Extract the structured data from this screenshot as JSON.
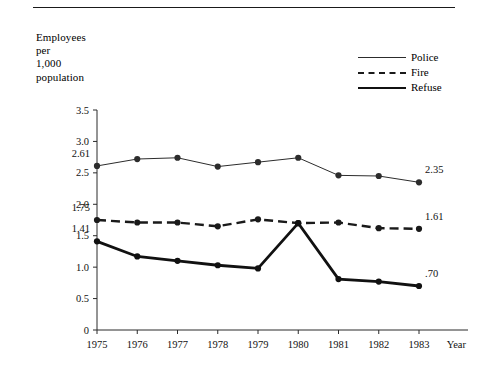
{
  "figure": {
    "axis_title": "Employees\nper\n1,000\npopulation",
    "year_axis_label": "Year",
    "top_rule": true
  },
  "legend": {
    "position": "top-right",
    "entries": [
      {
        "label": "Police",
        "style": "thin-solid",
        "color": "#2c2c2c"
      },
      {
        "label": "Fire",
        "style": "dashed",
        "color": "#1a1a1a"
      },
      {
        "label": "Refuse",
        "style": "thick-solid",
        "color": "#111111"
      }
    ]
  },
  "annotations": {
    "left": [
      {
        "series": "Police",
        "text": "2.61"
      },
      {
        "series": "Fire",
        "text": "1.75"
      },
      {
        "series": "Refuse",
        "text": "1.41"
      }
    ],
    "right": [
      {
        "series": "Police",
        "text": "2.35"
      },
      {
        "series": "Fire",
        "text": "1.61"
      },
      {
        "series": "Refuse",
        "text": ".70"
      }
    ]
  },
  "chart_data": {
    "type": "line",
    "title": "",
    "xlabel": "Year",
    "ylabel": "Employees per 1,000 population",
    "categories": [
      "1975",
      "1976",
      "1977",
      "1978",
      "1979",
      "1980",
      "1981",
      "1982",
      "1983"
    ],
    "x": [
      1975,
      1976,
      1977,
      1978,
      1979,
      1980,
      1981,
      1982,
      1983
    ],
    "ylim": [
      0,
      3.5
    ],
    "yticks": [
      0,
      0.5,
      1.0,
      1.5,
      2.0,
      2.5,
      3.0,
      3.5
    ],
    "ytick_labels": [
      "0",
      "0.5",
      "1.0",
      "1.5",
      "2.0",
      "2.5",
      "3.0",
      "3.5"
    ],
    "grid": false,
    "legend_position": "upper right",
    "markers": "filled-circle",
    "series": [
      {
        "name": "Police",
        "values": [
          2.61,
          2.72,
          2.74,
          2.6,
          2.67,
          2.74,
          2.46,
          2.45,
          2.35
        ],
        "style": "thin-solid",
        "color": "#2c2c2c",
        "first_label": "2.61",
        "last_label": "2.35"
      },
      {
        "name": "Fire",
        "values": [
          1.75,
          1.71,
          1.71,
          1.65,
          1.76,
          1.7,
          1.71,
          1.62,
          1.61
        ],
        "style": "dashed",
        "color": "#1a1a1a",
        "first_label": "1.75",
        "last_label": "1.61"
      },
      {
        "name": "Refuse",
        "values": [
          1.41,
          1.17,
          1.1,
          1.03,
          0.98,
          1.7,
          0.81,
          0.77,
          0.7
        ],
        "style": "thick-solid",
        "color": "#111111",
        "first_label": "1.41",
        "last_label": ".70"
      }
    ]
  }
}
